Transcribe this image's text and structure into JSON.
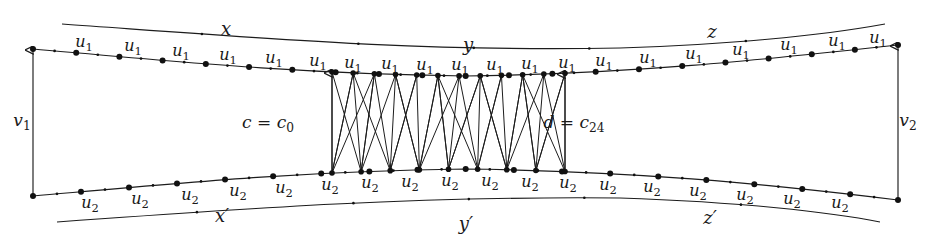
{
  "figure": {
    "stroke_color": "#1c1c1c",
    "background_color": "#ffffff",
    "vertex_color": "#111111"
  },
  "outer_arcs": {
    "top": [
      {
        "label": "x",
        "sub": "",
        "x": 226,
        "y": 35
      },
      {
        "label": "y",
        "sub": "",
        "x": 468,
        "y": 51
      },
      {
        "label": "z",
        "sub": "",
        "x": 712,
        "y": 38
      }
    ],
    "bottom": [
      {
        "label": "x",
        "sub": "′",
        "x": 222,
        "y": 222
      },
      {
        "label": "y",
        "sub": "′",
        "x": 466,
        "y": 230
      },
      {
        "label": "z",
        "sub": "′",
        "x": 710,
        "y": 224
      }
    ]
  },
  "side_arrows": {
    "left": {
      "label": "v",
      "sub": "1",
      "x": 22,
      "y": 126
    },
    "right": {
      "label": "v",
      "sub": "2",
      "x": 908,
      "y": 126
    }
  },
  "cut_labels": {
    "left": {
      "text": "c = c",
      "sub": "0",
      "x": 268,
      "y": 128
    },
    "right": {
      "text": "d = c",
      "sub": "24",
      "x": 574,
      "y": 128
    }
  },
  "edge_labels": {
    "top_symbol": "u",
    "top_sub": "1",
    "bottom_symbol": "u",
    "bottom_sub": "2",
    "top_positions": [
      {
        "x": 84,
        "y": 47
      },
      {
        "x": 133,
        "y": 51
      },
      {
        "x": 181,
        "y": 56
      },
      {
        "x": 228,
        "y": 60
      },
      {
        "x": 274,
        "y": 63
      },
      {
        "x": 318,
        "y": 66
      },
      {
        "x": 353,
        "y": 68
      },
      {
        "x": 390,
        "y": 69
      },
      {
        "x": 425,
        "y": 70
      },
      {
        "x": 460,
        "y": 70
      },
      {
        "x": 495,
        "y": 70
      },
      {
        "x": 530,
        "y": 69
      },
      {
        "x": 567,
        "y": 68
      },
      {
        "x": 604,
        "y": 66
      },
      {
        "x": 648,
        "y": 63
      },
      {
        "x": 694,
        "y": 59
      },
      {
        "x": 741,
        "y": 55
      },
      {
        "x": 789,
        "y": 50
      },
      {
        "x": 837,
        "y": 46
      },
      {
        "x": 878,
        "y": 43
      }
    ],
    "bottom_positions": [
      {
        "x": 90,
        "y": 208
      },
      {
        "x": 140,
        "y": 204
      },
      {
        "x": 190,
        "y": 200
      },
      {
        "x": 238,
        "y": 196
      },
      {
        "x": 284,
        "y": 193
      },
      {
        "x": 330,
        "y": 190
      },
      {
        "x": 370,
        "y": 188
      },
      {
        "x": 410,
        "y": 187
      },
      {
        "x": 450,
        "y": 186
      },
      {
        "x": 490,
        "y": 186
      },
      {
        "x": 530,
        "y": 187
      },
      {
        "x": 568,
        "y": 188
      },
      {
        "x": 608,
        "y": 190
      },
      {
        "x": 652,
        "y": 192
      },
      {
        "x": 698,
        "y": 196
      },
      {
        "x": 745,
        "y": 200
      },
      {
        "x": 792,
        "y": 204
      },
      {
        "x": 840,
        "y": 208
      }
    ]
  },
  "curves": {
    "top_outer": "M 62,24 C 260,38 420,52 620,48 C 740,44 830,34 885,24",
    "top_chain": "M 33,49 C 180,62 300,74 465,76 C 630,74 760,60 898,45",
    "bottom_chain": "M 33,196 C 180,183 300,171 465,169 C 630,171 760,183 898,200",
    "bottom_outer": "M 57,222 C 250,208 420,196 620,198 C 740,202 830,212 880,222"
  },
  "chain_counts": {
    "top_major_vertices": 21,
    "bottom_major_vertices": 19,
    "midpoint_ticks": "one small tick between each pair of major vertices"
  },
  "zigzag": {
    "left_boundary_x": 332,
    "right_boundary_x": 565,
    "top_node_count": 12,
    "bottom_node_count": 9,
    "description": "triangulated fan strip between c and d"
  }
}
